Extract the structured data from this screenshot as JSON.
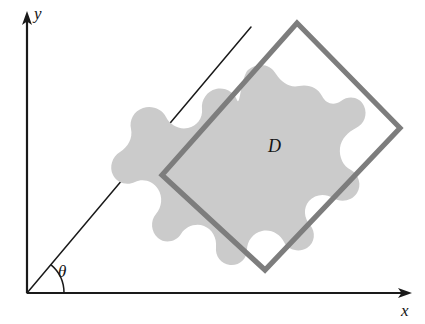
{
  "figure": {
    "background_color": "#ffffff"
  },
  "axes": {
    "origin": {
      "x": 27,
      "y": 293
    },
    "x_axis": {
      "label": "x",
      "name": "x-axis",
      "from": {
        "x": 27,
        "y": 293
      },
      "to": {
        "x": 411,
        "y": 293
      },
      "label_position": {
        "x": 401,
        "y": 316
      },
      "color": "#1a1a1a",
      "arrow": "end"
    },
    "y_axis": {
      "label": "y",
      "name": "y-axis",
      "from": {
        "x": 27,
        "y": 293
      },
      "to": {
        "x": 27,
        "y": 14
      },
      "label_position": {
        "x": 34,
        "y": 19
      },
      "color": "#1a1a1a",
      "arrow": "end"
    }
  },
  "ray": {
    "name": "rotation-ray",
    "from": {
      "x": 27,
      "y": 293
    },
    "to": {
      "x": 251,
      "y": 27
    },
    "color": "#1a1a1a",
    "angle_degrees": 50
  },
  "angle": {
    "label": "θ",
    "label_position": {
      "x": 58,
      "y": 277
    },
    "arc_radius": 37,
    "arc_start_degrees": 0,
    "arc_end_degrees": 50,
    "color": "#1a1a1a"
  },
  "rectangle": {
    "name": "rotated-bounding-rectangle",
    "stroke_color": "#7d7d7d",
    "stroke_width": 5.2,
    "fill": "none",
    "corners": [
      {
        "label": "top",
        "x": 297,
        "y": 23
      },
      {
        "label": "right",
        "x": 400,
        "y": 128
      },
      {
        "label": "bottom",
        "x": 265,
        "y": 270
      },
      {
        "label": "left",
        "x": 162,
        "y": 175
      }
    ]
  },
  "region": {
    "name": "region-d",
    "label": "D",
    "label_position": {
      "x": 268,
      "y": 152
    },
    "fill_color": "#cbcbcb",
    "outline_path": "M 248 70 C 258 62, 270 64, 276 74 C 282 83, 290 88, 299 86 C 309 84, 318 88, 322 96 C 326 104, 334 106, 341 101 C 349 95, 360 97, 364 106 C 368 115, 364 124, 356 128 C 348 132, 341 139, 340 148 C 339 157, 343 166, 351 170 C 359 175, 362 185, 357 193 C 352 201, 341 203, 333 198 C 325 193, 315 194, 309 201 C 303 208, 304 218, 310 225 C 316 232, 315 243, 307 248 C 299 253, 288 250, 284 242 C 280 234, 271 229, 262 231 C 253 233, 247 241, 247 250 C 247 259, 239 266, 230 265 C 221 264, 215 256, 216 247 C 217 238, 212 229, 204 226 C 196 223, 186 226, 181 234 C 176 242, 165 244, 158 238 C 151 232, 150 221, 156 214 C 162 207, 163 197, 158 189 C 153 181, 143 178, 135 182 C 127 186, 117 183, 113 175 C 109 167, 112 157, 120 152 C 128 147, 133 138, 131 129 C 129 120, 134 111, 143 108 C 152 105, 162 109, 166 117 C 170 125, 179 130, 188 128 C 197 126, 203 118, 202 109 C 201 100, 207 91, 216 89 C 225 87, 234 92, 237 100 C 240 108, 241 77, 248 70 Z"
  }
}
